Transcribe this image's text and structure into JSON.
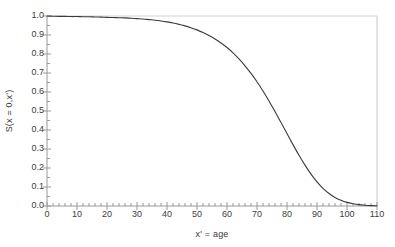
{
  "chart_data": {
    "type": "line",
    "title": "",
    "subtitle": "",
    "xlabel": "x' = age",
    "ylabel": "S(x = 0,x')",
    "xlim": [
      0,
      110
    ],
    "ylim": [
      0.0,
      1.0
    ],
    "grid": false,
    "legend": null,
    "legend_position": "none",
    "x_tick_labels": [
      "0",
      "10",
      "20",
      "30",
      "40",
      "50",
      "60",
      "70",
      "80",
      "90",
      "100",
      "110"
    ],
    "x_ticks": [
      0,
      10,
      20,
      30,
      40,
      50,
      60,
      70,
      80,
      90,
      100,
      110
    ],
    "x_minor_tick_step": 2,
    "y_tick_labels": [
      "0.0",
      "0.1",
      "0.2",
      "0.3",
      "0.4",
      "0.5",
      "0.6",
      "0.7",
      "0.8",
      "0.9",
      "1.0"
    ],
    "y_ticks": [
      0.0,
      0.1,
      0.2,
      0.3,
      0.4,
      0.5,
      0.6,
      0.7,
      0.8,
      0.9,
      1.0
    ],
    "y_minor_tick_step": 0.05,
    "line_color": "#3a3a3a",
    "axis_color": "#9a9a9a",
    "series": [
      {
        "name": "S(x=0,x')",
        "x": [
          0,
          2,
          4,
          6,
          8,
          10,
          12,
          14,
          16,
          18,
          20,
          22,
          24,
          26,
          28,
          30,
          32,
          34,
          36,
          38,
          40,
          42,
          44,
          46,
          48,
          50,
          52,
          54,
          56,
          58,
          60,
          62,
          64,
          66,
          68,
          70,
          72,
          74,
          76,
          78,
          80,
          82,
          84,
          86,
          88,
          90,
          92,
          94,
          96,
          98,
          100,
          102,
          104,
          106,
          108,
          110
        ],
        "values": [
          1.0,
          0.999,
          0.998,
          0.998,
          0.997,
          0.997,
          0.996,
          0.996,
          0.995,
          0.994,
          0.993,
          0.992,
          0.991,
          0.99,
          0.988,
          0.986,
          0.984,
          0.981,
          0.978,
          0.974,
          0.969,
          0.963,
          0.956,
          0.948,
          0.938,
          0.927,
          0.913,
          0.897,
          0.879,
          0.858,
          0.834,
          0.806,
          0.774,
          0.738,
          0.698,
          0.654,
          0.605,
          0.553,
          0.497,
          0.439,
          0.381,
          0.323,
          0.267,
          0.215,
          0.168,
          0.127,
          0.093,
          0.066,
          0.045,
          0.03,
          0.019,
          0.012,
          0.007,
          0.004,
          0.002,
          0.001
        ]
      }
    ],
    "annotations": []
  }
}
